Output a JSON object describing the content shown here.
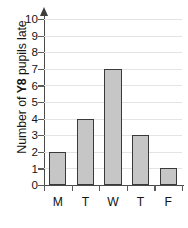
{
  "chart_data": {
    "type": "bar",
    "title": "",
    "xlabel": "",
    "ylabel": "Number of Y8 pupils late",
    "ylabel_prefix": "Number of ",
    "ylabel_emphasis": "Y8",
    "ylabel_suffix": " pupils late",
    "categories": [
      "M",
      "T",
      "W",
      "T",
      "F"
    ],
    "values": [
      2,
      4,
      7,
      3,
      1
    ],
    "ylim": [
      0,
      10
    ],
    "ytick_labels": [
      "10",
      "9",
      "8",
      "7",
      "6",
      "5",
      "4",
      "3",
      "2",
      "1",
      "0"
    ],
    "ytick_values": [
      10,
      9,
      8,
      7,
      6,
      5,
      4,
      3,
      2,
      1,
      0
    ],
    "grid": true,
    "legend": false,
    "colors": {
      "bar_fill": "#c6c6c6",
      "bar_border": "#3a3a3a",
      "gridline": "#e4e4e4",
      "axis": "#4a4a4a",
      "text": "#141414",
      "background": "#ffffff"
    }
  }
}
